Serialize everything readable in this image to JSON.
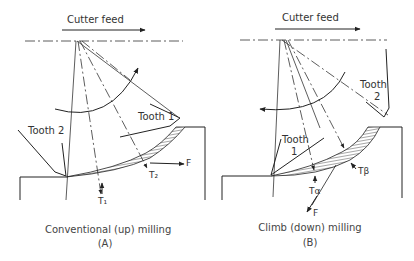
{
  "panels": [
    {
      "id": "A",
      "feed_label": "Cutter feed",
      "tooth1_label": "Tooth 1",
      "tooth2_label": "Tooth 2",
      "t1_label": "T₁",
      "t2_label": "T₂",
      "force_label": "F",
      "caption": "Conventional (up) milling",
      "caption_letter": "(A)"
    },
    {
      "id": "B",
      "feed_label": "Cutter feed",
      "tooth1_label_line1": "Tooth",
      "tooth1_label_line2": "1",
      "tooth2_label_line1": "Tooth",
      "tooth2_label_line2": "2",
      "ta_label": "Tα",
      "tb_label": "Tβ",
      "force_label": "F",
      "caption": "Climb (down) milling",
      "caption_letter": "(B)"
    }
  ]
}
